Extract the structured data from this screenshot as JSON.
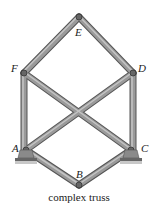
{
  "diagram": {
    "title": "complex truss",
    "joints": [
      {
        "id": "E",
        "label": "E"
      },
      {
        "id": "F",
        "label": "F"
      },
      {
        "id": "D",
        "label": "D"
      },
      {
        "id": "A",
        "label": "A"
      },
      {
        "id": "C",
        "label": "C"
      },
      {
        "id": "B",
        "label": "B"
      }
    ],
    "members": [
      [
        "E",
        "F"
      ],
      [
        "E",
        "D"
      ],
      [
        "F",
        "A"
      ],
      [
        "D",
        "C"
      ],
      [
        "F",
        "C"
      ],
      [
        "D",
        "A"
      ],
      [
        "A",
        "B"
      ],
      [
        "C",
        "B"
      ]
    ],
    "supports": [
      "A",
      "C"
    ],
    "colors": {
      "member": "#8a8a8a",
      "member_edge": "#555555",
      "support": "#9a9a9a"
    }
  }
}
